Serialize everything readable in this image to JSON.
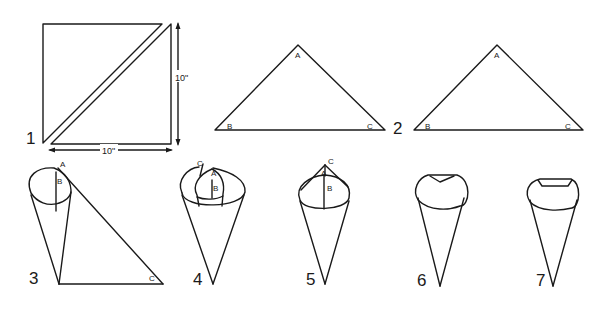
{
  "diagram": {
    "steps": [
      {
        "number": "1",
        "description": "Square cut diagonally into two triangles",
        "dimensions": {
          "width": "10\"",
          "height": "10\""
        }
      },
      {
        "number": "2",
        "description": "Two triangles with vertices labeled",
        "vertices": [
          "A",
          "B",
          "C"
        ]
      },
      {
        "number": "3",
        "description": "Roll corner B to A forming a cone",
        "vertices": [
          "A",
          "B",
          "C"
        ]
      },
      {
        "number": "4",
        "description": "Wrap corner C around the cone",
        "vertices": [
          "C",
          "A",
          "B"
        ]
      },
      {
        "number": "5",
        "description": "Points A, B and C aligned at the top",
        "vertices": [
          "C",
          "A",
          "B"
        ]
      },
      {
        "number": "6",
        "description": "Fold top edge down"
      },
      {
        "number": "7",
        "description": "Finished cone with folded top"
      }
    ],
    "labels": {
      "dim_width": "10\"",
      "dim_height": "10\"",
      "A": "A",
      "B": "B",
      "C": "C"
    }
  }
}
